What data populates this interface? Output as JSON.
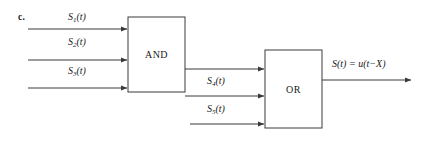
{
  "figure": {
    "part_label": "c.",
    "background_color": "#ffffff",
    "line_color": "#3a3a3a",
    "text_color": "#1a1a1a"
  },
  "gates": [
    {
      "id": "and-gate",
      "label": "AND",
      "x": 128,
      "y": 17,
      "width": 57,
      "height": 75
    },
    {
      "id": "or-gate",
      "label": "OR",
      "x": 265,
      "y": 50,
      "width": 57,
      "height": 78
    }
  ],
  "inputs": [
    {
      "id": "input-1",
      "label_prefix": "S",
      "label_sub": "1",
      "label_suffix": "(t)",
      "label_text": "S₁(t)",
      "line_y": 29,
      "line_x_start": 28,
      "line_x_end": 128,
      "label_x": 68,
      "label_y": 11
    },
    {
      "id": "input-2",
      "label_prefix": "S",
      "label_sub": "2",
      "label_suffix": "(t)",
      "label_text": "S₂(t)",
      "line_y": 60,
      "line_x_start": 28,
      "line_x_end": 128,
      "label_x": 68,
      "label_y": 36
    },
    {
      "id": "input-3",
      "label_prefix": "S",
      "label_sub": "3",
      "label_suffix": "(t)",
      "label_text": "S₃(t)",
      "line_y": 88,
      "line_x_start": 28,
      "line_x_end": 128,
      "label_x": 68,
      "label_y": 65
    },
    {
      "id": "input-4",
      "label_prefix": "S",
      "label_sub": "4",
      "label_suffix": "(t)",
      "label_text": "S₄(t)",
      "line_y": 96,
      "line_x_start": 185,
      "line_x_end": 265,
      "label_x": 207,
      "label_y": 75
    },
    {
      "id": "input-5",
      "label_prefix": "S",
      "label_sub": "5",
      "label_suffix": "(t)",
      "label_text": "S₅(t)",
      "line_y": 124,
      "line_x_start": 190,
      "line_x_end": 265,
      "label_x": 207,
      "label_y": 103
    }
  ],
  "connections": [
    {
      "id": "and-to-or",
      "from": "and-gate",
      "to": "or-gate",
      "line_y": 69,
      "line_x_start": 185,
      "line_x_end": 265
    }
  ],
  "output": {
    "id": "output-signal",
    "label_text": "S(t) = u(t−X)",
    "expr_lhs": "S(t)",
    "equals": "=",
    "expr_rhs": "u(t−X)",
    "line_y": 80,
    "line_x_start": 322,
    "line_x_end": 412,
    "label_x": 332,
    "label_y": 58
  }
}
